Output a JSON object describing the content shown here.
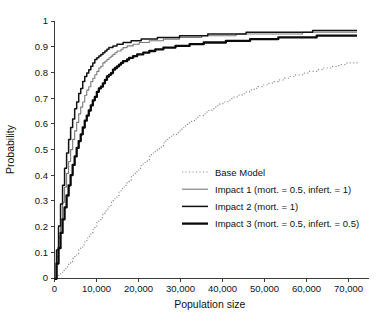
{
  "chart_data": {
    "type": "line",
    "title": "",
    "xlabel": "Population size",
    "ylabel": "Probability",
    "xlim": [
      0,
      72000
    ],
    "ylim": [
      0,
      1
    ],
    "grid": false,
    "legend_position": "inside lower-right",
    "xticks": [
      0,
      10000,
      20000,
      30000,
      40000,
      50000,
      60000,
      70000
    ],
    "xticklabels": [
      "0",
      "10,000",
      "20,000",
      "30,000",
      "40,000",
      "50,000",
      "60,000",
      "70,000"
    ],
    "yticks": [
      0,
      0.1,
      0.2,
      0.3,
      0.4,
      0.5,
      0.6,
      0.7,
      0.8,
      0.9,
      1
    ],
    "yticklabels": [
      "0",
      "0.1",
      "0.2",
      "0.3",
      "0.4",
      "0.5",
      "0.6",
      "0.7",
      "0.8",
      "0.9",
      "1"
    ],
    "series": [
      {
        "name": "Base Model",
        "style": "dotted",
        "color": "#8c8c8c",
        "width": 1.2,
        "x": [
          0,
          1000,
          2000,
          3000,
          4000,
          5000,
          6000,
          7000,
          8000,
          9000,
          10000,
          12000,
          14000,
          16000,
          18000,
          20000,
          22000,
          24000,
          26000,
          28000,
          30000,
          33000,
          36000,
          39000,
          42000,
          45000,
          48000,
          51000,
          54000,
          57000,
          60000,
          63000,
          66000,
          69000,
          72000
        ],
        "values": [
          0,
          0.012,
          0.028,
          0.046,
          0.066,
          0.088,
          0.112,
          0.136,
          0.161,
          0.186,
          0.211,
          0.259,
          0.305,
          0.348,
          0.388,
          0.426,
          0.461,
          0.494,
          0.524,
          0.552,
          0.578,
          0.614,
          0.645,
          0.673,
          0.698,
          0.72,
          0.74,
          0.757,
          0.773,
          0.787,
          0.799,
          0.811,
          0.822,
          0.832,
          0.841
        ]
      },
      {
        "name": "Impact 1 (mort. = 0.5, infert. = 1)",
        "style": "solid",
        "color": "#7a7a7a",
        "width": 1.1,
        "x": [
          0,
          500,
          1000,
          1500,
          2000,
          2500,
          3000,
          4000,
          5000,
          6000,
          7000,
          8000,
          9000,
          10000,
          12000,
          14000,
          16000,
          18000,
          20000,
          23000,
          26000,
          29000,
          32000,
          36000,
          40000,
          44000,
          48000,
          52000,
          56000,
          60000,
          64000,
          68000,
          72000
        ],
        "values": [
          0,
          0.085,
          0.165,
          0.238,
          0.304,
          0.365,
          0.42,
          0.513,
          0.589,
          0.65,
          0.701,
          0.742,
          0.776,
          0.804,
          0.845,
          0.873,
          0.892,
          0.905,
          0.913,
          0.921,
          0.927,
          0.932,
          0.936,
          0.941,
          0.944,
          0.947,
          0.949,
          0.951,
          0.952,
          0.953,
          0.954,
          0.955,
          0.956
        ]
      },
      {
        "name": "Impact 2 (mort. = 1)",
        "style": "solid",
        "color": "#121212",
        "width": 1.5,
        "x": [
          0,
          500,
          1000,
          1500,
          2000,
          2500,
          3000,
          4000,
          5000,
          6000,
          7000,
          8000,
          9000,
          10000,
          12000,
          14000,
          16000,
          18000,
          20000,
          23000,
          26000,
          29000,
          32000,
          36000,
          40000,
          44000,
          48000,
          52000,
          56000,
          60000,
          64000,
          68000,
          72000
        ],
        "values": [
          0,
          0.112,
          0.213,
          0.3,
          0.376,
          0.443,
          0.502,
          0.598,
          0.672,
          0.729,
          0.774,
          0.809,
          0.836,
          0.857,
          0.886,
          0.903,
          0.913,
          0.92,
          0.925,
          0.931,
          0.935,
          0.939,
          0.942,
          0.946,
          0.949,
          0.952,
          0.954,
          0.956,
          0.958,
          0.959,
          0.96,
          0.961,
          0.962
        ]
      },
      {
        "name": "Impact 3 (mort. = 0.5, infert. = 0.5)",
        "style": "solid",
        "color": "#0a0a0a",
        "width": 2.3,
        "x": [
          0,
          500,
          1000,
          1500,
          2000,
          2500,
          3000,
          4000,
          5000,
          6000,
          7000,
          8000,
          9000,
          10000,
          12000,
          14000,
          16000,
          18000,
          20000,
          23000,
          26000,
          29000,
          32000,
          36000,
          40000,
          44000,
          48000,
          52000,
          56000,
          60000,
          64000,
          68000,
          72000
        ],
        "values": [
          0,
          0.062,
          0.123,
          0.18,
          0.234,
          0.284,
          0.331,
          0.415,
          0.487,
          0.549,
          0.602,
          0.647,
          0.686,
          0.72,
          0.772,
          0.81,
          0.838,
          0.857,
          0.87,
          0.884,
          0.894,
          0.901,
          0.907,
          0.914,
          0.919,
          0.924,
          0.928,
          0.932,
          0.935,
          0.938,
          0.941,
          0.943,
          0.945
        ]
      }
    ],
    "legend_entries": [
      {
        "label": "Base Model",
        "style": "dotted",
        "color": "#8c8c8c",
        "width": 1.2
      },
      {
        "label": "Impact 1 (mort. = 0.5, infert. = 1)",
        "style": "solid",
        "color": "#7a7a7a",
        "width": 1.1
      },
      {
        "label": "Impact 2 (mort. = 1)",
        "style": "solid",
        "color": "#121212",
        "width": 1.5
      },
      {
        "label": "Impact 3 (mort. = 0.5, infert. = 0.5)",
        "style": "solid",
        "color": "#0a0a0a",
        "width": 2.3
      }
    ]
  }
}
